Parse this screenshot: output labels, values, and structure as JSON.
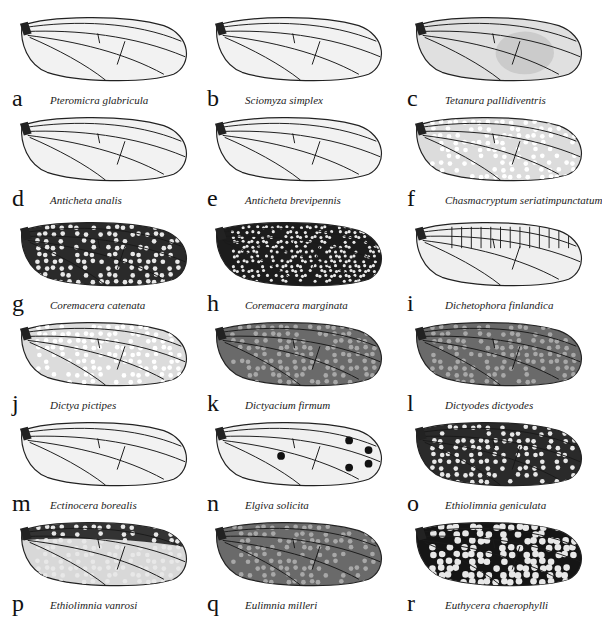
{
  "figure": {
    "panels": [
      {
        "letter": "a",
        "species": "Pteromicra glabricula",
        "pattern": "clear"
      },
      {
        "letter": "b",
        "species": "Sciomyza simplex",
        "pattern": "clear"
      },
      {
        "letter": "c",
        "species": "Tetanura pallidiventris",
        "pattern": "clear-shaded"
      },
      {
        "letter": "d",
        "species": "Anticheta analis",
        "pattern": "clear"
      },
      {
        "letter": "e",
        "species": "Anticheta brevipennis",
        "pattern": "clear"
      },
      {
        "letter": "f",
        "species": "Chasmacryptum seriatimpunctatum",
        "pattern": "light-spotted"
      },
      {
        "letter": "g",
        "species": "Coremacera catenata",
        "pattern": "dark-spotted"
      },
      {
        "letter": "h",
        "species": "Coremacera marginata",
        "pattern": "dark-reticulate"
      },
      {
        "letter": "i",
        "species": "Dichetophora finlandica",
        "pattern": "light-banded"
      },
      {
        "letter": "j",
        "species": "Dictya pictipes",
        "pattern": "light-spotted"
      },
      {
        "letter": "k",
        "species": "Dictyacium firmum",
        "pattern": "grey-reticulate"
      },
      {
        "letter": "l",
        "species": "Dictyodes dictyodes",
        "pattern": "grey-reticulate"
      },
      {
        "letter": "m",
        "species": "Ectinocera borealis",
        "pattern": "clear"
      },
      {
        "letter": "n",
        "species": "Elgiva solicita",
        "pattern": "clear-dotted"
      },
      {
        "letter": "o",
        "species": "Ethiolimnia geniculata",
        "pattern": "dark-spotted"
      },
      {
        "letter": "p",
        "species": "Ethiolimnia vanrosi",
        "pattern": "dark-margin"
      },
      {
        "letter": "q",
        "species": "Eulimnia milleri",
        "pattern": "grey-reticulate"
      },
      {
        "letter": "r",
        "species": "Euthycera chaerophylli",
        "pattern": "dark-spotted-heavy"
      }
    ]
  }
}
